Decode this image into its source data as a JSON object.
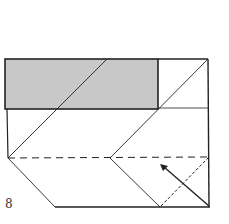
{
  "diagram": {
    "type": "origami-fold-step",
    "step_number": "8",
    "colors": {
      "shaded": "#c8c8c8",
      "line": "#222222"
    },
    "elements": [
      "shaded-flap",
      "valley-fold-line-dashed",
      "fold-line-dotted",
      "fold-arrow"
    ]
  }
}
